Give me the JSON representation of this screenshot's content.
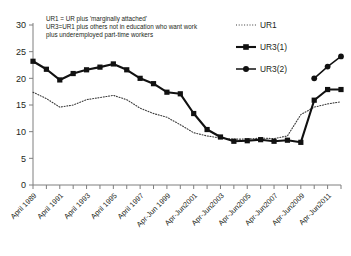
{
  "chart_data": {
    "type": "line",
    "title": "",
    "xlabel": "",
    "ylabel": "",
    "ylim": [
      0,
      30
    ],
    "yticks": [
      0,
      5,
      10,
      15,
      20,
      25,
      30
    ],
    "grid": false,
    "legend_position": "top-right",
    "x": [
      "April 1989",
      "April 1990",
      "April 1991",
      "April 1992",
      "April 1993",
      "April 1994",
      "April 1995",
      "April 1996",
      "April 1997",
      "April 1998",
      "Apr-Jun 1999",
      "Apr-Jun2000",
      "Apr-Jun2001",
      "Apr-Jun2002",
      "Apr-Jun2003",
      "Apr-Jun2004",
      "Apr-Jun2005",
      "Apr-Jun2006",
      "Apr-Jun2007",
      "Apr-Jun2008",
      "Apr-Jun2009",
      "Apr-Jun2010",
      "Apr-Jun2011",
      "Apr-Jun2012"
    ],
    "xtick_labels": [
      "April 1989",
      "April 1991",
      "April 1993",
      "April 1995",
      "April 1997",
      "Apr-Jun 1999",
      "Apr-Jun2001",
      "Apr-Jun2003",
      "Apr-Jun2005",
      "Apr-Jun2007",
      "Apr-Jun2009",
      "Apr-Jun2011"
    ],
    "series": [
      {
        "name": "UR1",
        "style": "dotted",
        "marker": "none",
        "color": "#3b3b3b",
        "values": [
          17.4,
          16.2,
          14.6,
          15.0,
          16.0,
          16.4,
          16.8,
          16.0,
          14.4,
          13.4,
          12.7,
          11.3,
          9.8,
          9.2,
          8.8,
          8.6,
          8.6,
          8.8,
          8.7,
          9.2,
          13.2,
          14.6,
          15.2,
          15.6
        ]
      },
      {
        "name": "UR3(1)",
        "style": "solid",
        "marker": "square",
        "color": "#111111",
        "values": [
          23.2,
          21.7,
          19.7,
          20.9,
          21.6,
          22.1,
          22.7,
          21.6,
          20.0,
          19.0,
          17.4,
          17.1,
          13.4,
          10.4,
          9.0,
          8.2,
          8.3,
          8.5,
          8.2,
          8.4,
          8.0,
          15.9,
          17.9,
          17.9
        ]
      },
      {
        "name": "UR3(2)",
        "style": "solid",
        "marker": "circle",
        "color": "#111111",
        "values": [
          null,
          null,
          null,
          null,
          null,
          null,
          null,
          null,
          null,
          null,
          null,
          null,
          null,
          null,
          null,
          null,
          null,
          null,
          null,
          null,
          null,
          20.0,
          22.2,
          24.1
        ]
      }
    ],
    "annotations": [
      "UR1 = UR plus 'marginally attached'",
      "UR3=UR1 plus others not in education who want work",
      "plus underemployed  part-time  workers"
    ]
  },
  "legend": {
    "items": [
      {
        "label": "UR1"
      },
      {
        "label": "UR3(1)"
      },
      {
        "label": "UR3(2)"
      }
    ]
  }
}
